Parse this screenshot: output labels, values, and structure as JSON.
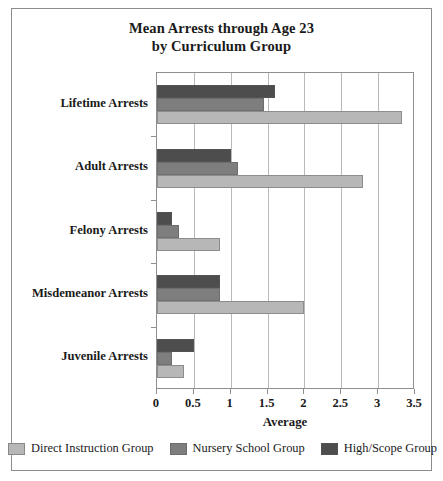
{
  "chart_data": {
    "type": "bar",
    "orientation": "horizontal",
    "title": "Mean Arrests through Age 23 by Curriculum Group",
    "title_line1": "Mean Arrests through Age 23",
    "title_line2": "by Curriculum Group",
    "xlabel": "Average",
    "ylabel": "",
    "xlim": [
      0,
      3.5
    ],
    "xticks": [
      "0",
      "0.5",
      "1",
      "1.5",
      "2",
      "2.5",
      "3",
      "3.5"
    ],
    "xtick_values": [
      0,
      0.5,
      1,
      1.5,
      2,
      2.5,
      3,
      3.5
    ],
    "grid": "vertical",
    "legend_position": "bottom",
    "categories": [
      "Lifetime Arrests",
      "Adult Arrests",
      "Felony Arrests",
      "Misdemeanor Arrests",
      "Juvenile Arrests"
    ],
    "series": [
      {
        "name": "High/Scope Group",
        "color": "#4d4d4d",
        "values": [
          1.6,
          1.0,
          0.2,
          0.85,
          0.5
        ]
      },
      {
        "name": "Nursery School Group",
        "color": "#7e7e7e",
        "values": [
          1.45,
          1.1,
          0.3,
          0.85,
          0.2
        ]
      },
      {
        "name": "Direct Instruction Group",
        "color": "#b7b7b7",
        "values": [
          3.33,
          2.8,
          0.86,
          2.0,
          0.36
        ]
      }
    ]
  },
  "legend": {
    "items": [
      {
        "label": "Direct Instruction Group",
        "color": "#b7b7b7"
      },
      {
        "label": "Nursery School Group",
        "color": "#7e7e7e"
      },
      {
        "label": "High/Scope Group",
        "color": "#4d4d4d"
      }
    ]
  }
}
